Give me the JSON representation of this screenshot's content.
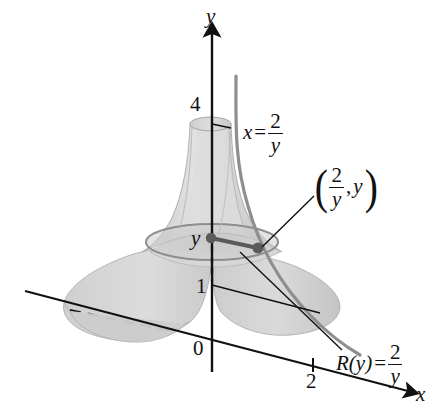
{
  "figure": {
    "kind": "3d-solid-of-revolution",
    "axes": {
      "y_axis_label": "y",
      "x_axis_label": "x",
      "origin_label": "0"
    },
    "tick_labels": {
      "y_top": "4",
      "y_one": "1",
      "x_two": "2"
    },
    "annotations": {
      "curve_equation": {
        "lhs": "x",
        "operator": "=",
        "numerator": "2",
        "denominator": "y"
      },
      "point_label": {
        "open_paren": "(",
        "numerator": "2",
        "denominator": "y",
        "comma": ",",
        "second": "y",
        "close_paren": ")"
      },
      "radius_equation": {
        "lhs": "R(y)",
        "operator": "=",
        "numerator": "2",
        "denominator": "y"
      }
    },
    "colors": {
      "ink": "#111111",
      "surface_light": "#d9d9d9",
      "surface_mid": "#c6c6c6",
      "surface_dark": "#b4b4b4",
      "curve": "#808080",
      "marker": "#5a5a5a",
      "background": "#ffffff"
    }
  }
}
